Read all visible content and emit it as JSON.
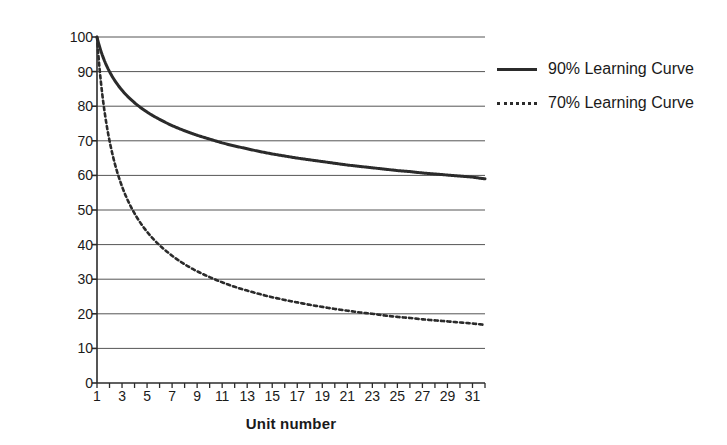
{
  "chart_data": {
    "type": "line",
    "title": "",
    "xlabel": "Unit number",
    "ylabel": "Task time [h]",
    "xlim": [
      1,
      32
    ],
    "ylim": [
      0,
      100
    ],
    "grid": true,
    "legend_position": "right",
    "xticks": [
      1,
      3,
      5,
      7,
      9,
      11,
      13,
      15,
      17,
      19,
      21,
      23,
      25,
      27,
      29,
      31
    ],
    "yticks": [
      0,
      10,
      20,
      30,
      40,
      50,
      60,
      70,
      80,
      90,
      100
    ],
    "x": [
      1,
      2,
      3,
      4,
      5,
      6,
      7,
      8,
      9,
      10,
      11,
      12,
      13,
      14,
      15,
      16,
      17,
      18,
      19,
      20,
      21,
      22,
      23,
      24,
      25,
      26,
      27,
      28,
      29,
      30,
      31,
      32
    ],
    "series": [
      {
        "name": "90% Learning Curve",
        "style": "solid",
        "color": "#2b2b2b",
        "values": [
          100.0,
          90.0,
          84.6,
          81.0,
          78.3,
          76.2,
          74.4,
          72.9,
          71.6,
          70.5,
          69.4,
          68.5,
          67.7,
          66.9,
          66.2,
          65.6,
          65.0,
          64.5,
          64.0,
          63.5,
          63.0,
          62.6,
          62.2,
          61.8,
          61.4,
          61.1,
          60.7,
          60.4,
          60.1,
          59.8,
          59.5,
          59.0
        ]
      },
      {
        "name": "70% Learning Curve",
        "style": "dashed",
        "color": "#2b2b2b",
        "values": [
          100.0,
          70.0,
          56.8,
          49.0,
          43.7,
          39.8,
          36.8,
          34.3,
          32.3,
          30.6,
          29.1,
          27.8,
          26.7,
          25.7,
          24.8,
          24.0,
          23.3,
          22.6,
          22.0,
          21.4,
          20.9,
          20.4,
          20.0,
          19.5,
          19.1,
          18.8,
          18.4,
          18.1,
          17.8,
          17.5,
          17.2,
          16.8
        ]
      }
    ]
  },
  "legend": {
    "items": [
      {
        "label": "90% Learning Curve",
        "style": "solid"
      },
      {
        "label": "70% Learning Curve",
        "style": "dashed"
      }
    ]
  }
}
